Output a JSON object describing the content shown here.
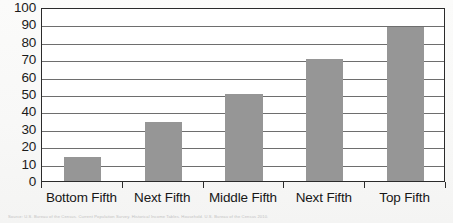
{
  "chart_data": {
    "type": "bar",
    "title": "",
    "subtitle": "",
    "xlabel": "",
    "ylabel": "",
    "categories": [
      "Bottom Fifth",
      "Next Fifth",
      "Middle Fifth",
      "Next Fifth",
      "Top Fifth"
    ],
    "values": [
      14,
      34,
      50,
      70,
      88.5
    ],
    "series": [
      {
        "name": "",
        "values": [
          14,
          34,
          50,
          70,
          88.5
        ]
      }
    ],
    "ylim": [
      0,
      100
    ],
    "y_ticks": [
      0,
      10,
      20,
      30,
      40,
      50,
      60,
      70,
      80,
      90,
      100
    ],
    "y_tick_labels": [
      "0",
      "10",
      "20",
      "30",
      "40",
      "50",
      "60",
      "70",
      "80",
      "90",
      "100"
    ],
    "grid": "horizontal",
    "legend": "none",
    "annotations": [],
    "bar_color": "#969696",
    "plot_border_color": "#2b2b2b",
    "gridline_color": "#6e6e6e",
    "plot_background": "#ffffff"
  },
  "footer": {
    "source_note": "Source: U.S. Bureau of the Census. Current Population Survey. Historical Income Tables. Household. U.S. Bureau of the Census 2010."
  }
}
